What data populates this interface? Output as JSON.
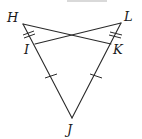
{
  "diagram": {
    "type": "geometry",
    "points": {
      "H": {
        "label": "H",
        "x": 23,
        "y": 24,
        "lx": 7,
        "ly": 22
      },
      "L": {
        "label": "L",
        "x": 121,
        "y": 23,
        "lx": 124,
        "ly": 21
      },
      "I": {
        "label": "I",
        "x": 35,
        "y": 44,
        "lx": 24,
        "ly": 54
      },
      "K": {
        "label": "K",
        "x": 111,
        "y": 44,
        "lx": 113,
        "ly": 54
      },
      "J": {
        "label": "J",
        "x": 72,
        "y": 118,
        "lx": 67,
        "ly": 134
      }
    },
    "segments": [
      {
        "from": "H",
        "to": "K"
      },
      {
        "from": "L",
        "to": "I"
      },
      {
        "from": "H",
        "to": "J"
      },
      {
        "from": "L",
        "to": "J"
      }
    ],
    "tick_marks": [
      {
        "segment": "HI",
        "count": 2
      },
      {
        "segment": "LK",
        "count": 2
      },
      {
        "segment": "IJ",
        "count": 1
      },
      {
        "segment": "KJ",
        "count": 1
      }
    ],
    "colors": {
      "line": "#2a2a2a",
      "label": "#1a1a1a",
      "background": "#ffffff"
    }
  }
}
